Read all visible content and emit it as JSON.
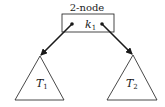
{
  "diagram": {
    "node_label": "2-node",
    "key": {
      "base": "k",
      "subscript": "1"
    },
    "subtrees": [
      {
        "base": "T",
        "subscript": "1"
      },
      {
        "base": "T",
        "subscript": "2"
      }
    ],
    "colors": {
      "stroke": "#1a1a1a",
      "background": "#ffffff"
    }
  }
}
